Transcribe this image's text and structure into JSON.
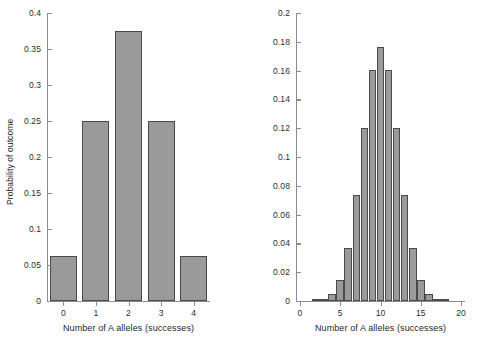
{
  "chart_data": [
    {
      "type": "bar",
      "id": "left-panel",
      "title": "",
      "xlabel": "Number of A alleles (successes)",
      "ylabel": "Probability of outcome",
      "categories": [
        "0",
        "1",
        "2",
        "3",
        "4"
      ],
      "x": [
        0,
        1,
        2,
        3,
        4
      ],
      "values": [
        0.0625,
        0.25,
        0.375,
        0.25,
        0.0625
      ],
      "xlim": [
        -0.5,
        4.5
      ],
      "ylim": [
        0,
        0.4
      ],
      "y_ticks": [
        0,
        0.05,
        0.1,
        0.15,
        0.2,
        0.25,
        0.3,
        0.35,
        0.4
      ],
      "y_tick_labels": [
        "0",
        "0.05",
        "0.1",
        "0.15",
        "0.2",
        "0.25",
        "0.3",
        "0.35",
        "0.4"
      ],
      "x_ticks": [
        0,
        1,
        2,
        3,
        4
      ],
      "x_tick_labels": [
        "0",
        "1",
        "2",
        "3",
        "4"
      ],
      "grid": false,
      "legend": "none",
      "bar_fill": "#9a9a9a",
      "bar_edge": "#4a4a4a",
      "axis_color": "#8c8c8c"
    },
    {
      "type": "bar",
      "id": "right-panel",
      "title": "",
      "xlabel": "Number of A alleles (successes)",
      "ylabel": "",
      "categories": [
        "0",
        "1",
        "2",
        "3",
        "4",
        "5",
        "6",
        "7",
        "8",
        "9",
        "10",
        "11",
        "12",
        "13",
        "14",
        "15",
        "16",
        "17",
        "18",
        "19",
        "20"
      ],
      "x": [
        0,
        1,
        2,
        3,
        4,
        5,
        6,
        7,
        8,
        9,
        10,
        11,
        12,
        13,
        14,
        15,
        16,
        17,
        18,
        19,
        20
      ],
      "values": [
        1e-06,
        1.9e-05,
        0.000181,
        0.001087,
        0.004621,
        0.014786,
        0.036964,
        0.073929,
        0.120134,
        0.160179,
        0.176197,
        0.160179,
        0.120134,
        0.073929,
        0.036964,
        0.014786,
        0.004621,
        0.001087,
        0.000181,
        1.9e-05,
        1e-06
      ],
      "xlim": [
        -0.5,
        20.5
      ],
      "ylim": [
        0,
        0.2
      ],
      "y_ticks": [
        0,
        0.02,
        0.04,
        0.06,
        0.08,
        0.1,
        0.12,
        0.14,
        0.16,
        0.18,
        0.2
      ],
      "y_tick_labels": [
        "0",
        "0.02",
        "0.04",
        "0.06",
        "0.08",
        "0.1",
        "0.12",
        "0.14",
        "0.16",
        "0.18",
        "0.2"
      ],
      "x_ticks": [
        0,
        5,
        10,
        15,
        20
      ],
      "x_tick_labels": [
        "0",
        "5",
        "10",
        "15",
        "20"
      ],
      "grid": false,
      "legend": "none",
      "bar_fill": "#9a9a9a",
      "bar_edge": "#4a4a4a",
      "axis_color": "#8c8c8c"
    }
  ]
}
